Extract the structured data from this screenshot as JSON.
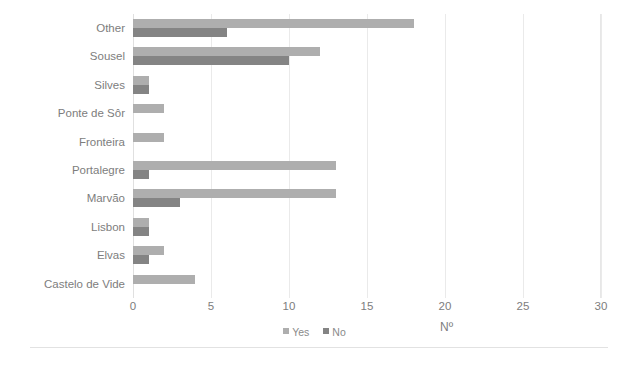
{
  "chart_data": {
    "type": "bar",
    "orientation": "horizontal",
    "title": "",
    "xlabel": "Nº",
    "ylabel": "",
    "xlim": [
      0,
      30
    ],
    "xticks": [
      "0",
      "5",
      "10",
      "15",
      "20",
      "25",
      "30"
    ],
    "grid": true,
    "legend_position": "bottom-center",
    "categories": [
      "Other",
      "Sousel",
      "Silves",
      "Ponte de Sôr",
      "Fronteira",
      "Portalegre",
      "Marvão",
      "Lisbon",
      "Elvas",
      "Castelo de Vide"
    ],
    "series": [
      {
        "name": "Yes",
        "color": "#aeaeae",
        "values": [
          18,
          12,
          1,
          2,
          2,
          13,
          13,
          1,
          2,
          4
        ]
      },
      {
        "name": "No",
        "color": "#848484",
        "values": [
          6,
          10,
          1,
          0,
          0,
          1,
          3,
          1,
          1,
          0
        ]
      }
    ]
  },
  "legend": {
    "items": [
      {
        "label": "Yes",
        "color": "#aeaeae"
      },
      {
        "label": "No",
        "color": "#848484"
      }
    ]
  }
}
